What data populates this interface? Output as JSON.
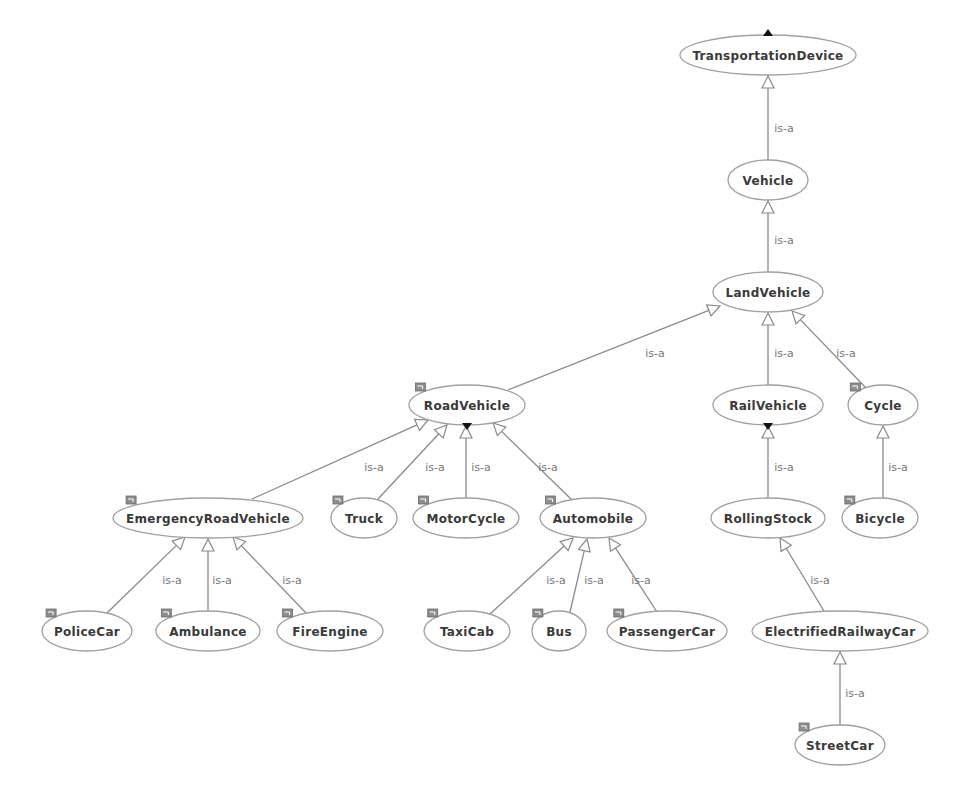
{
  "diagram": {
    "edge_label": "is-a",
    "colors": {
      "edge": "#8a8a8a",
      "node_border": "#a0a0a0",
      "node_text": "#3a3a3a",
      "edge_text": "#777777",
      "badge": "#8e8e8e"
    },
    "nodes": [
      {
        "id": "TransportationDevice",
        "label": "TransportationDevice",
        "cx": 768,
        "cy": 55,
        "rx": 88,
        "ry": 20,
        "badge": false,
        "expand": "up"
      },
      {
        "id": "Vehicle",
        "label": "Vehicle",
        "cx": 768,
        "cy": 180,
        "rx": 40,
        "ry": 20,
        "badge": false,
        "expand": null
      },
      {
        "id": "LandVehicle",
        "label": "LandVehicle",
        "cx": 768,
        "cy": 292,
        "rx": 55,
        "ry": 20,
        "badge": false,
        "expand": null
      },
      {
        "id": "RoadVehicle",
        "label": "RoadVehicle",
        "cx": 467,
        "cy": 405,
        "rx": 58,
        "ry": 20,
        "badge": true,
        "expand": "down"
      },
      {
        "id": "RailVehicle",
        "label": "RailVehicle",
        "cx": 768,
        "cy": 405,
        "rx": 55,
        "ry": 20,
        "badge": false,
        "expand": "down"
      },
      {
        "id": "Cycle",
        "label": "Cycle",
        "cx": 883,
        "cy": 405,
        "rx": 35,
        "ry": 20,
        "badge": true,
        "expand": null
      },
      {
        "id": "EmergencyRoadVehicle",
        "label": "EmergencyRoadVehicle",
        "cx": 208,
        "cy": 518,
        "rx": 95,
        "ry": 20,
        "badge": true,
        "expand": null
      },
      {
        "id": "Truck",
        "label": "Truck",
        "cx": 364,
        "cy": 518,
        "rx": 33,
        "ry": 20,
        "badge": true,
        "expand": null
      },
      {
        "id": "MotorCycle",
        "label": "MotorCycle",
        "cx": 466,
        "cy": 518,
        "rx": 53,
        "ry": 20,
        "badge": true,
        "expand": null
      },
      {
        "id": "Automobile",
        "label": "Automobile",
        "cx": 593,
        "cy": 518,
        "rx": 53,
        "ry": 20,
        "badge": true,
        "expand": null
      },
      {
        "id": "RollingStock",
        "label": "RollingStock",
        "cx": 768,
        "cy": 518,
        "rx": 57,
        "ry": 20,
        "badge": false,
        "expand": null
      },
      {
        "id": "Bicycle",
        "label": "Bicycle",
        "cx": 880,
        "cy": 518,
        "rx": 38,
        "ry": 20,
        "badge": true,
        "expand": null
      },
      {
        "id": "PoliceCar",
        "label": "PoliceCar",
        "cx": 87,
        "cy": 631,
        "rx": 45,
        "ry": 20,
        "badge": true,
        "expand": null
      },
      {
        "id": "Ambulance",
        "label": "Ambulance",
        "cx": 208,
        "cy": 631,
        "rx": 52,
        "ry": 20,
        "badge": true,
        "expand": null
      },
      {
        "id": "FireEngine",
        "label": "FireEngine",
        "cx": 330,
        "cy": 631,
        "rx": 53,
        "ry": 20,
        "badge": true,
        "expand": null
      },
      {
        "id": "TaxiCab",
        "label": "TaxiCab",
        "cx": 467,
        "cy": 631,
        "rx": 43,
        "ry": 20,
        "badge": true,
        "expand": null
      },
      {
        "id": "Bus",
        "label": "Bus",
        "cx": 559,
        "cy": 631,
        "rx": 27,
        "ry": 20,
        "badge": true,
        "expand": null
      },
      {
        "id": "PassengerCar",
        "label": "PassengerCar",
        "cx": 667,
        "cy": 631,
        "rx": 60,
        "ry": 20,
        "badge": true,
        "expand": null
      },
      {
        "id": "ElectrifiedRailwayCar",
        "label": "ElectrifiedRailwayCar",
        "cx": 840,
        "cy": 631,
        "rx": 88,
        "ry": 20,
        "badge": false,
        "expand": null
      },
      {
        "id": "StreetCar",
        "label": "StreetCar",
        "cx": 840,
        "cy": 745,
        "rx": 45,
        "ry": 20,
        "badge": true,
        "expand": null
      }
    ],
    "edges": [
      {
        "from": "Vehicle",
        "to": "TransportationDevice",
        "label": "is-a",
        "sx": 768,
        "sy": 160,
        "tx": 768,
        "ty": 76,
        "lx": 784,
        "ly": 128
      },
      {
        "from": "LandVehicle",
        "to": "Vehicle",
        "label": "is-a",
        "sx": 768,
        "sy": 272,
        "tx": 768,
        "ty": 201,
        "lx": 784,
        "ly": 240
      },
      {
        "from": "RoadVehicle",
        "to": "LandVehicle",
        "label": "is-a",
        "sx": 508,
        "sy": 390,
        "tx": 720,
        "ty": 306,
        "lx": 655,
        "ly": 353
      },
      {
        "from": "RailVehicle",
        "to": "LandVehicle",
        "label": "is-a",
        "sx": 768,
        "sy": 385,
        "tx": 768,
        "ty": 313,
        "lx": 784,
        "ly": 353
      },
      {
        "from": "Cycle",
        "to": "LandVehicle",
        "label": "is-a",
        "sx": 866,
        "sy": 388,
        "tx": 792,
        "ty": 311,
        "lx": 846,
        "ly": 353
      },
      {
        "from": "EmergencyRoadVehicle",
        "to": "RoadVehicle",
        "label": "is-a",
        "sx": 252,
        "sy": 499,
        "tx": 428,
        "ty": 420,
        "lx": 374,
        "ly": 467
      },
      {
        "from": "Truck",
        "to": "RoadVehicle",
        "label": "is-a",
        "sx": 378,
        "sy": 499,
        "tx": 447,
        "ty": 425,
        "lx": 435,
        "ly": 467
      },
      {
        "from": "MotorCycle",
        "to": "RoadVehicle",
        "label": "is-a",
        "sx": 466,
        "sy": 498,
        "tx": 466,
        "ty": 426,
        "lx": 481,
        "ly": 467
      },
      {
        "from": "Automobile",
        "to": "RoadVehicle",
        "label": "is-a",
        "sx": 572,
        "sy": 500,
        "tx": 493,
        "ty": 423,
        "lx": 548,
        "ly": 467
      },
      {
        "from": "RollingStock",
        "to": "RailVehicle",
        "label": "is-a",
        "sx": 768,
        "sy": 498,
        "tx": 768,
        "ty": 426,
        "lx": 784,
        "ly": 467
      },
      {
        "from": "Bicycle",
        "to": "Cycle",
        "label": "is-a",
        "sx": 883,
        "sy": 498,
        "tx": 883,
        "ty": 426,
        "lx": 898,
        "ly": 467
      },
      {
        "from": "PoliceCar",
        "to": "EmergencyRoadVehicle",
        "label": "is-a",
        "sx": 107,
        "sy": 613,
        "tx": 185,
        "ty": 537,
        "lx": 172,
        "ly": 580
      },
      {
        "from": "Ambulance",
        "to": "EmergencyRoadVehicle",
        "label": "is-a",
        "sx": 208,
        "sy": 611,
        "tx": 208,
        "ty": 539,
        "lx": 222,
        "ly": 580
      },
      {
        "from": "FireEngine",
        "to": "EmergencyRoadVehicle",
        "label": "is-a",
        "sx": 306,
        "sy": 613,
        "tx": 233,
        "ty": 537,
        "lx": 292,
        "ly": 580
      },
      {
        "from": "TaxiCab",
        "to": "Automobile",
        "label": "is-a",
        "sx": 490,
        "sy": 614,
        "tx": 573,
        "ty": 538,
        "lx": 556,
        "ly": 580
      },
      {
        "from": "Bus",
        "to": "Automobile",
        "label": "is-a",
        "sx": 570,
        "sy": 612,
        "tx": 587,
        "ty": 539,
        "lx": 594,
        "ly": 580
      },
      {
        "from": "PassengerCar",
        "to": "Automobile",
        "label": "is-a",
        "sx": 657,
        "sy": 612,
        "tx": 609,
        "ty": 538,
        "lx": 641,
        "ly": 580
      },
      {
        "from": "ElectrifiedRailwayCar",
        "to": "RollingStock",
        "label": "is-a",
        "sx": 824,
        "sy": 611,
        "tx": 780,
        "ty": 538,
        "lx": 820,
        "ly": 580
      },
      {
        "from": "StreetCar",
        "to": "ElectrifiedRailwayCar",
        "label": "is-a",
        "sx": 840,
        "sy": 725,
        "tx": 840,
        "ty": 652,
        "lx": 855,
        "ly": 693
      }
    ]
  }
}
